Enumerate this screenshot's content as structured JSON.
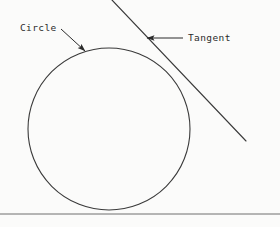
{
  "figure": {
    "kind": "geometry-diagram",
    "canvas": {
      "width": 280,
      "height": 227
    },
    "background_color": "#fbfbfa",
    "stroke_color": "#3a3a3a",
    "text_color": "#2b2b2b",
    "baseline_color": "#6e6e6e"
  },
  "shapes": {
    "circle": {
      "name": "Circle",
      "center_x": 109,
      "center_y": 129,
      "radius": 81,
      "stroke_width": 1.1
    },
    "tangent": {
      "name": "Tangent",
      "x1": 112,
      "y1": 0,
      "x2": 246,
      "y2": 141,
      "stroke_width": 1.1,
      "touch_point_x": 172,
      "touch_point_y": 72
    },
    "baseline": {
      "name": "Baseline",
      "x1": 0,
      "y1": 214,
      "x2": 280,
      "y2": 214,
      "stroke_width": 1
    }
  },
  "annotations": [
    {
      "id": "circle",
      "label": "Circle",
      "label_x": 20,
      "label_y": 28,
      "leader_x1": 61,
      "leader_y1": 29,
      "leader_x2": 85,
      "leader_y2": 51,
      "arrow_at": "end"
    },
    {
      "id": "tangent",
      "label": "Tangent",
      "label_x": 188,
      "label_y": 38,
      "leader_x1": 183,
      "leader_y1": 38,
      "leader_x2": 147,
      "leader_y2": 38,
      "arrow_at": "end"
    }
  ]
}
